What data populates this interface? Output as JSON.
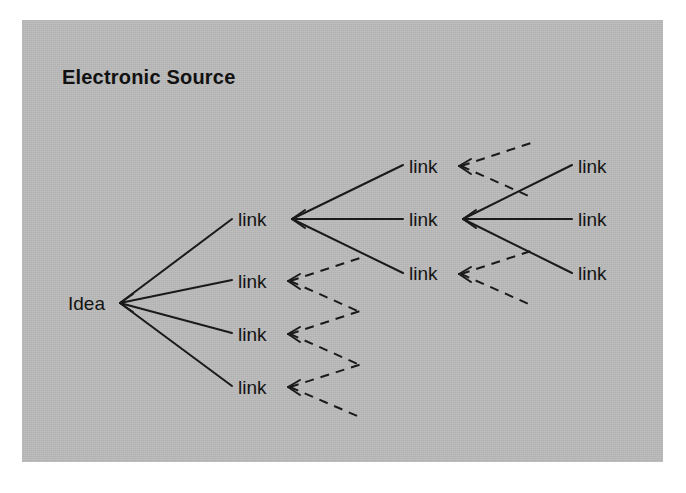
{
  "panel": {
    "background_color": "#b9b9b9",
    "page_background_color": "#ffffff"
  },
  "header": {
    "title": "Electronic Source"
  },
  "diagram": {
    "type": "tree",
    "root_label": "Idea",
    "node_label": "link",
    "line_color": "#1a1a1a",
    "solid_edge_style": "solid",
    "dashed_edge_style": "dashed",
    "columns": [
      {
        "index": 1,
        "nodes": [
          {
            "id": "idea",
            "label": "Idea",
            "x": 68,
            "y": 303
          }
        ]
      },
      {
        "index": 2,
        "nodes": [
          {
            "id": "c2n1",
            "label": "link",
            "x": 238,
            "y": 222
          },
          {
            "id": "c2n2",
            "label": "link",
            "x": 238,
            "y": 283
          },
          {
            "id": "c2n3",
            "label": "link",
            "x": 238,
            "y": 336
          },
          {
            "id": "c2n4",
            "label": "link",
            "x": 238,
            "y": 389
          }
        ]
      },
      {
        "index": 3,
        "nodes": [
          {
            "id": "c3n1",
            "label": "link",
            "x": 409,
            "y": 168
          },
          {
            "id": "c3n2",
            "label": "link",
            "x": 409,
            "y": 222
          },
          {
            "id": "c3n3",
            "label": "link",
            "x": 409,
            "y": 276
          }
        ]
      },
      {
        "index": 4,
        "nodes": [
          {
            "id": "c4n1",
            "label": "link",
            "x": 578,
            "y": 168
          },
          {
            "id": "c4n2",
            "label": "link",
            "x": 578,
            "y": 222
          },
          {
            "id": "c4n3",
            "label": "link",
            "x": 578,
            "y": 276
          }
        ]
      }
    ],
    "edges": [
      {
        "from": "idea",
        "to": "c2n1",
        "style": "solid"
      },
      {
        "from": "idea",
        "to": "c2n2",
        "style": "solid"
      },
      {
        "from": "idea",
        "to": "c2n3",
        "style": "solid"
      },
      {
        "from": "idea",
        "to": "c2n4",
        "style": "solid"
      },
      {
        "from": "c2n1",
        "to": "c3n1",
        "style": "solid"
      },
      {
        "from": "c2n1",
        "to": "c3n2",
        "style": "solid"
      },
      {
        "from": "c2n1",
        "to": "c3n3",
        "style": "solid"
      },
      {
        "from": "c2n2",
        "to": "stub",
        "style": "dashed"
      },
      {
        "from": "c2n3",
        "to": "stub",
        "style": "dashed"
      },
      {
        "from": "c2n4",
        "to": "stub",
        "style": "dashed"
      },
      {
        "from": "c3n1",
        "to": "stub",
        "style": "dashed"
      },
      {
        "from": "c3n2",
        "to": "c4n1",
        "style": "solid"
      },
      {
        "from": "c3n2",
        "to": "c4n2",
        "style": "solid"
      },
      {
        "from": "c3n2",
        "to": "c4n3",
        "style": "solid"
      },
      {
        "from": "c3n3",
        "to": "stub",
        "style": "dashed"
      }
    ],
    "arrowheads": [
      {
        "at": "idea",
        "direction": "right"
      },
      {
        "at": "c2n1",
        "direction": "right"
      },
      {
        "at": "c2n2",
        "direction": "right"
      },
      {
        "at": "c2n3",
        "direction": "right"
      },
      {
        "at": "c2n4",
        "direction": "right"
      },
      {
        "at": "c3n1",
        "direction": "right"
      },
      {
        "at": "c3n2",
        "direction": "right"
      },
      {
        "at": "c3n3",
        "direction": "right"
      }
    ]
  },
  "labels": {
    "idea": "Idea",
    "c2n1": "link",
    "c2n2": "link",
    "c2n3": "link",
    "c2n4": "link",
    "c3n1": "link",
    "c3n2": "link",
    "c3n3": "link",
    "c4n1": "link",
    "c4n2": "link",
    "c4n3": "link"
  }
}
